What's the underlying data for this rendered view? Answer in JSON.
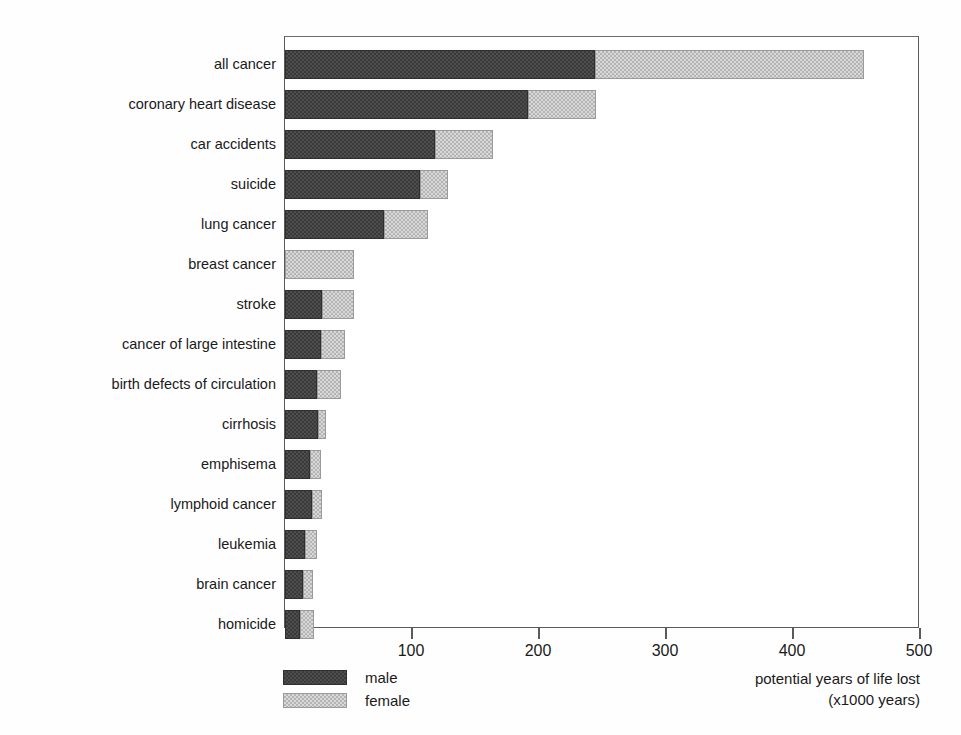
{
  "chart_data": {
    "type": "bar",
    "orientation": "horizontal",
    "stacked": true,
    "title": "",
    "xlabel": "potential years of life lost (x1000 years)",
    "ylabel": "",
    "xlim": [
      0,
      500
    ],
    "xticks": [
      0,
      100,
      200,
      300,
      400,
      500
    ],
    "xticklabels": [
      "",
      "100",
      "200",
      "300",
      "400",
      "500"
    ],
    "grid": false,
    "legend_position": "below-left",
    "categories": [
      "all cancer",
      "coronary heart disease",
      "car accidents",
      "suicide",
      "lung cancer",
      "breast cancer",
      "stroke",
      "cancer of large intestine",
      "birth defects of circulation",
      "cirrhosis",
      "emphisema",
      "lymphoid cancer",
      "leukemia",
      "brain cancer",
      "homicide"
    ],
    "series": [
      {
        "name": "male",
        "color": "#4e4e4e",
        "values": [
          244,
          191,
          118,
          106,
          78,
          0,
          29,
          28,
          25,
          26,
          20,
          21,
          16,
          14,
          12
        ]
      },
      {
        "name": "female",
        "color": "#d8d8d8",
        "values": [
          212,
          54,
          46,
          22,
          35,
          54,
          25,
          19,
          19,
          6,
          8,
          8,
          9,
          8,
          11
        ]
      }
    ],
    "totals": [
      456,
      245,
      164,
      128,
      113,
      54,
      54,
      47,
      44,
      32,
      28,
      29,
      25,
      22,
      23
    ]
  },
  "axis": {
    "tick_labels": [
      "100",
      "200",
      "300",
      "400",
      "500"
    ],
    "tick_values": [
      100,
      200,
      300,
      400,
      500
    ],
    "title_line1": "potential years of life lost",
    "title_line2": "(x1000 years)"
  },
  "legend": {
    "items": [
      {
        "label": "male",
        "color": "#4e4e4e"
      },
      {
        "label": "female",
        "color": "#d8d8d8"
      }
    ]
  }
}
